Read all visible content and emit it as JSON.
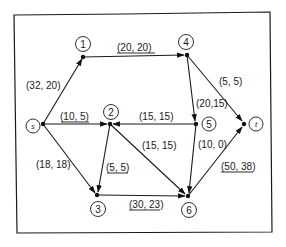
{
  "diagram": {
    "type": "flow-network",
    "nodes": [
      {
        "id": "s",
        "label": "s"
      },
      {
        "id": "1",
        "label": "1"
      },
      {
        "id": "2",
        "label": "2"
      },
      {
        "id": "3",
        "label": "3"
      },
      {
        "id": "4",
        "label": "4"
      },
      {
        "id": "5",
        "label": "5"
      },
      {
        "id": "6",
        "label": "6"
      },
      {
        "id": "t",
        "label": "t"
      }
    ],
    "edges": [
      {
        "from": "s",
        "to": "1",
        "label": "(32, 20)",
        "underlined": false
      },
      {
        "from": "1",
        "to": "4",
        "label": "(20, 20)",
        "underlined": true
      },
      {
        "from": "s",
        "to": "2",
        "label": "(10, 5)",
        "underlined": true
      },
      {
        "from": "s",
        "to": "3",
        "label": "(18, 18)",
        "underlined": false
      },
      {
        "from": "5",
        "to": "2",
        "label": "(15, 15)",
        "underlined": false
      },
      {
        "from": "2",
        "to": "3",
        "label": "(5, 5)",
        "underlined": true
      },
      {
        "from": "2",
        "to": "6",
        "label": "(15, 15)",
        "underlined": false
      },
      {
        "from": "4",
        "to": "5",
        "label": "(20,15)",
        "underlined": false
      },
      {
        "from": "4",
        "to": "t",
        "label": "(5, 5)",
        "underlined": false
      },
      {
        "from": "5",
        "to": "6",
        "label": "(10, 0)",
        "underlined": false
      },
      {
        "from": "3",
        "to": "6",
        "label": "(30, 23)",
        "underlined": true
      },
      {
        "from": "6",
        "to": "t",
        "label": "(50, 38)",
        "underlined": true
      }
    ]
  }
}
